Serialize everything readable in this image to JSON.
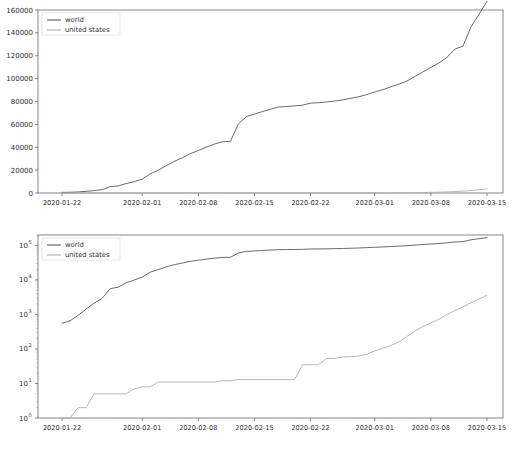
{
  "figure": {
    "background": "#ffffff",
    "width": 514,
    "height": 450,
    "panel_count": 2
  },
  "colors": {
    "world": "#595959",
    "united_states": "#b0b0b0",
    "axis": "#555555",
    "text": "#303030"
  },
  "chart_data": [
    {
      "type": "line",
      "title": "",
      "subtitle": "",
      "xlabel": "",
      "ylabel": "",
      "scale": "linear",
      "grid": false,
      "legend_position": "upper left",
      "ylim": [
        0,
        160000
      ],
      "ytick_labels": [
        "0",
        "20000",
        "40000",
        "60000",
        "80000",
        "100000",
        "120000",
        "140000",
        "160000"
      ],
      "ytick_values": [
        0,
        20000,
        40000,
        60000,
        80000,
        100000,
        120000,
        140000,
        160000
      ],
      "xtick_labels": [
        "2020-01-22",
        "2020-02-01",
        "2020-02-08",
        "2020-02-15",
        "2020-02-22",
        "2020-03-01",
        "2020-03-08",
        "2020-03-15"
      ],
      "xtick_dates": [
        "2020-01-22",
        "2020-02-01",
        "2020-02-08",
        "2020-02-15",
        "2020-02-22",
        "2020-03-01",
        "2020-03-08",
        "2020-03-15"
      ],
      "xlim": [
        "2020-01-19",
        "2020-03-17"
      ],
      "x": [
        "2020-01-22",
        "2020-01-23",
        "2020-01-24",
        "2020-01-25",
        "2020-01-26",
        "2020-01-27",
        "2020-01-28",
        "2020-01-29",
        "2020-01-30",
        "2020-01-31",
        "2020-02-01",
        "2020-02-02",
        "2020-02-03",
        "2020-02-04",
        "2020-02-05",
        "2020-02-06",
        "2020-02-07",
        "2020-02-08",
        "2020-02-09",
        "2020-02-10",
        "2020-02-11",
        "2020-02-12",
        "2020-02-13",
        "2020-02-14",
        "2020-02-15",
        "2020-02-16",
        "2020-02-17",
        "2020-02-18",
        "2020-02-19",
        "2020-02-20",
        "2020-02-21",
        "2020-02-22",
        "2020-02-23",
        "2020-02-24",
        "2020-02-25",
        "2020-02-26",
        "2020-02-27",
        "2020-02-28",
        "2020-02-29",
        "2020-03-01",
        "2020-03-02",
        "2020-03-03",
        "2020-03-04",
        "2020-03-05",
        "2020-03-06",
        "2020-03-07",
        "2020-03-08",
        "2020-03-09",
        "2020-03-10",
        "2020-03-11",
        "2020-03-12",
        "2020-03-13",
        "2020-03-14",
        "2020-03-15"
      ],
      "series": [
        {
          "name": "world",
          "color": "#595959",
          "values": [
            555,
            653,
            941,
            1434,
            2118,
            2927,
            5578,
            6166,
            8234,
            9927,
            12038,
            16787,
            19881,
            23892,
            27635,
            30794,
            34391,
            37120,
            40150,
            42762,
            44802,
            45221,
            60368,
            66885,
            69030,
            71224,
            73258,
            75136,
            75639,
            76197,
            76823,
            78579,
            78965,
            79568,
            80413,
            81395,
            82754,
            84120,
            86011,
            88369,
            90306,
            92840,
            95120,
            97886,
            101801,
            105847,
            109821,
            113590,
            118620,
            125875,
            128352,
            145205,
            156101,
            167454
          ],
          "final_value": 156101
        },
        {
          "name": "united states",
          "color": "#b0b0b0",
          "values": [
            1,
            1,
            2,
            2,
            5,
            5,
            5,
            5,
            5,
            7,
            8,
            8,
            11,
            11,
            11,
            11,
            11,
            11,
            11,
            11,
            12,
            12,
            13,
            13,
            13,
            13,
            13,
            13,
            13,
            13,
            35,
            35,
            35,
            53,
            53,
            59,
            60,
            62,
            70,
            88,
            104,
            125,
            159,
            227,
            331,
            444,
            564,
            728,
            994,
            1301,
            1630,
            2183,
            2770,
            3613
          ],
          "final_value": 3613
        }
      ]
    },
    {
      "type": "line",
      "title": "",
      "subtitle": "",
      "xlabel": "",
      "ylabel": "",
      "scale": "log",
      "grid": false,
      "legend_position": "upper left",
      "ylim": [
        1,
        200000
      ],
      "ytick_labels": [
        "10^0",
        "10^1",
        "10^2",
        "10^3",
        "10^4",
        "10^5"
      ],
      "ytick_values": [
        1,
        10,
        100,
        1000,
        10000,
        100000
      ],
      "xtick_labels": [
        "2020-01-22",
        "2020-02-01",
        "2020-02-08",
        "2020-02-15",
        "2020-02-22",
        "2020-03-01",
        "2020-03-08",
        "2020-03-15"
      ],
      "xtick_dates": [
        "2020-01-22",
        "2020-02-01",
        "2020-02-08",
        "2020-02-15",
        "2020-02-22",
        "2020-03-01",
        "2020-03-08",
        "2020-03-15"
      ],
      "xlim": [
        "2020-01-19",
        "2020-03-17"
      ],
      "x": [
        "2020-01-22",
        "2020-01-23",
        "2020-01-24",
        "2020-01-25",
        "2020-01-26",
        "2020-01-27",
        "2020-01-28",
        "2020-01-29",
        "2020-01-30",
        "2020-01-31",
        "2020-02-01",
        "2020-02-02",
        "2020-02-03",
        "2020-02-04",
        "2020-02-05",
        "2020-02-06",
        "2020-02-07",
        "2020-02-08",
        "2020-02-09",
        "2020-02-10",
        "2020-02-11",
        "2020-02-12",
        "2020-02-13",
        "2020-02-14",
        "2020-02-15",
        "2020-02-16",
        "2020-02-17",
        "2020-02-18",
        "2020-02-19",
        "2020-02-20",
        "2020-02-21",
        "2020-02-22",
        "2020-02-23",
        "2020-02-24",
        "2020-02-25",
        "2020-02-26",
        "2020-02-27",
        "2020-02-28",
        "2020-02-29",
        "2020-03-01",
        "2020-03-02",
        "2020-03-03",
        "2020-03-04",
        "2020-03-05",
        "2020-03-06",
        "2020-03-07",
        "2020-03-08",
        "2020-03-09",
        "2020-03-10",
        "2020-03-11",
        "2020-03-12",
        "2020-03-13",
        "2020-03-14",
        "2020-03-15"
      ],
      "series": [
        {
          "name": "world",
          "color": "#595959",
          "values": [
            555,
            653,
            941,
            1434,
            2118,
            2927,
            5578,
            6166,
            8234,
            9927,
            12038,
            16787,
            19881,
            23892,
            27635,
            30794,
            34391,
            37120,
            40150,
            42762,
            44802,
            45221,
            60368,
            66885,
            69030,
            71224,
            73258,
            75136,
            75639,
            76197,
            76823,
            78579,
            78965,
            79568,
            80413,
            81395,
            82754,
            84120,
            86011,
            88369,
            90306,
            92840,
            95120,
            97886,
            101801,
            105847,
            109821,
            113590,
            118620,
            125875,
            128352,
            145205,
            156101,
            167454
          ],
          "final_value": 156101
        },
        {
          "name": "united states",
          "color": "#b0b0b0",
          "values": [
            1,
            1,
            2,
            2,
            5,
            5,
            5,
            5,
            5,
            7,
            8,
            8,
            11,
            11,
            11,
            11,
            11,
            11,
            11,
            11,
            12,
            12,
            13,
            13,
            13,
            13,
            13,
            13,
            13,
            13,
            35,
            35,
            35,
            53,
            53,
            59,
            60,
            62,
            70,
            88,
            104,
            125,
            159,
            227,
            331,
            444,
            564,
            728,
            994,
            1301,
            1630,
            2183,
            2770,
            3613
          ],
          "final_value": 3613
        }
      ]
    }
  ],
  "legend": {
    "entries": [
      {
        "label": "world",
        "color": "#595959"
      },
      {
        "label": "united states",
        "color": "#b0b0b0"
      }
    ]
  }
}
